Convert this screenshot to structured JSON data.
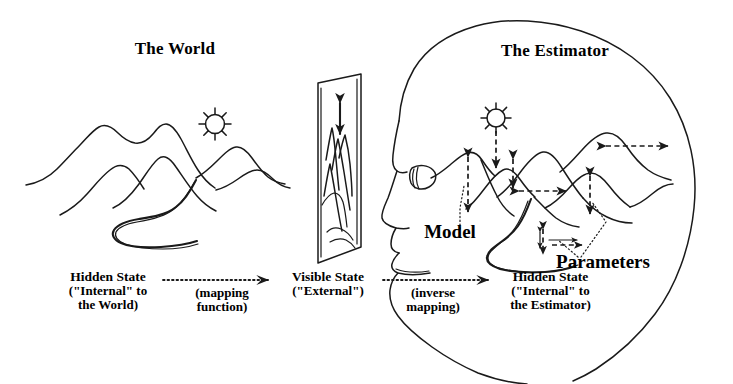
{
  "figure": {
    "name": "world-estimator-diagram",
    "background": "#ffffff",
    "ink_color": "#1a1a1a"
  },
  "titles": {
    "world": "The World",
    "estimator": "The Estimator"
  },
  "inner_labels": {
    "model": "Model",
    "parameters": "Parameters"
  },
  "captions": {
    "hidden_state_world": {
      "line1": "Hidden State",
      "line2": "(\"Internal\" to",
      "line3": "the World)"
    },
    "mapping_function": {
      "line1": "(mapping",
      "line2": "function)"
    },
    "visible_state": {
      "line1": "Visible State",
      "line2": "(\"External\")"
    },
    "inverse_mapping": {
      "line1": "(inverse",
      "line2": "mapping)"
    },
    "hidden_state_estimator": {
      "line1": "Hidden State",
      "line2": "(\"Internal\" to",
      "line3": "the Estimator)"
    }
  },
  "icons": {
    "world_sun": "sun-icon",
    "estimator_sun": "sun-icon",
    "world_mountains": "mountain-range-icon",
    "world_river": "river-icon",
    "image_plane": "projection-plane-icon",
    "image_plane_sun_arrow": "double-arrow-icon",
    "head_profile": "head-profile-icon",
    "eye": "eye-icon",
    "estimator_mountains": "mountain-range-icon",
    "estimator_river": "river-icon",
    "parameter_arrows": "double-arrow-icon",
    "mapping_connector": "dotted-arrow-icon",
    "inverse_mapping_connector": "dotted-arrow-icon",
    "model_leader": "leader-line-icon",
    "parameters_leader": "leader-line-icon"
  }
}
